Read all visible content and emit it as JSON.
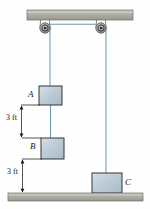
{
  "figure": {
    "background_color": "#fefefe"
  },
  "colors": {
    "beam_fill": "#a9a9a1",
    "beam_fill_light": "#c2c2ba",
    "beam_stroke": "#6e6e66",
    "ground_fill": "#a9a9a1",
    "ground_fill_light": "#c2c2ba",
    "ground_stroke": "#6e6e66",
    "block_fill": "#b9cad5",
    "block_fill_light": "#d2dee5",
    "block_stroke": "#3a3a3a",
    "cord": "#6d9aa9",
    "pulley_outer": "#8e8e86",
    "pulley_inner": "#3c3c3c",
    "dimension_line": "#1a1a1a",
    "label_text": "#1a1a1a"
  },
  "ceiling": {
    "name": "ceiling-beam",
    "x": 27,
    "y": 10,
    "width": 106,
    "height": 10
  },
  "ground": {
    "name": "ground-surface",
    "x": 8,
    "y": 193,
    "width": 135,
    "height": 8
  },
  "pulleys": [
    {
      "id": "left-pulley",
      "cx": 45,
      "cy": 28,
      "r_outer": 5.2,
      "r_inner": 2.0
    },
    {
      "id": "right-pulley",
      "cx": 101,
      "cy": 28,
      "r_outer": 5.2,
      "r_inner": 2.0
    }
  ],
  "cords": [
    {
      "id": "cord-between-pulleys",
      "x1": 45,
      "y1": 24,
      "x2": 101,
      "y2": 24
    },
    {
      "id": "cord-left-to-block-a",
      "x1": 50,
      "y1": 28,
      "x2": 50,
      "y2": 86
    },
    {
      "id": "cord-block-a-to-block-b",
      "x1": 50,
      "y1": 105,
      "x2": 50,
      "y2": 138
    },
    {
      "id": "cord-right-to-block-c",
      "x1": 106,
      "y1": 28,
      "x2": 106,
      "y2": 173
    }
  ],
  "blocks": [
    {
      "id": "block-a",
      "label": "A",
      "label_side": "left",
      "x": 39,
      "y": 86,
      "width": 23,
      "height": 19,
      "label_x": 28,
      "label_y": 91
    },
    {
      "id": "block-b",
      "label": "B",
      "label_side": "left",
      "x": 41,
      "y": 138,
      "width": 23,
      "height": 21,
      "label_x": 30,
      "label_y": 143
    },
    {
      "id": "block-c",
      "label": "C",
      "label_side": "right",
      "x": 92,
      "y": 173,
      "width": 30,
      "height": 20,
      "label_x": 125,
      "label_y": 179
    }
  ],
  "dimensions": [
    {
      "id": "dimension-a-to-b",
      "text": "3 ft",
      "x": 21,
      "y_top": 105,
      "y_bottom": 138,
      "text_x": 12,
      "text_y": 117
    },
    {
      "id": "dimension-b-to-ground",
      "text": "3 ft",
      "x": 22,
      "y_top": 159,
      "y_bottom": 193,
      "text_x": 13,
      "text_y": 171
    }
  ]
}
